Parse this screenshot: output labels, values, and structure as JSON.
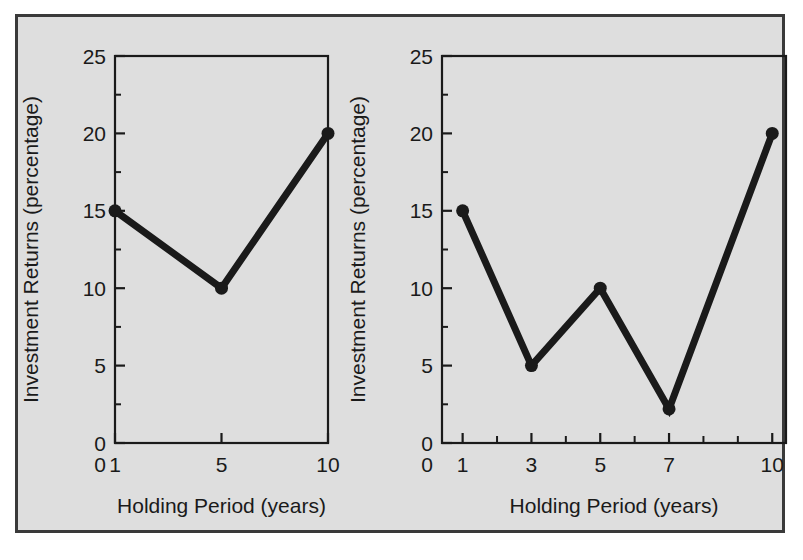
{
  "figure": {
    "background_color": "#dedede",
    "page_color": "#ffffff",
    "frame_color": "#3a3a3a",
    "series_color": "#1a1a1a"
  },
  "chart_data": [
    {
      "type": "line",
      "panel": "left",
      "title": "",
      "xlabel": "Holding Period (years)",
      "ylabel": "Investment Returns (percentage)",
      "x": [
        1,
        5,
        10
      ],
      "values": [
        15,
        10,
        20
      ],
      "xtick_labels": [
        "1",
        "5",
        "10"
      ],
      "xtick_values": [
        1,
        5,
        10
      ],
      "x_origin_label": "0",
      "ytick_labels": [
        "0",
        "5",
        "10",
        "15",
        "20",
        "25"
      ],
      "ytick_values": [
        0,
        5,
        10,
        15,
        20,
        25
      ],
      "yminor_values": [
        2.5,
        7.5,
        12.5,
        17.5,
        22.5
      ],
      "ylim": [
        0,
        25
      ],
      "grid": false,
      "legend": "none",
      "markers": "filled-circle",
      "x_spacing": "categorical"
    },
    {
      "type": "line",
      "panel": "right",
      "title": "",
      "xlabel": "Holding Period (years)",
      "ylabel": "Investment Returns (percentage)",
      "x": [
        1,
        3,
        5,
        7,
        10
      ],
      "values": [
        15,
        5,
        10,
        2.2,
        20
      ],
      "xtick_labels": [
        "1",
        "3",
        "5",
        "7",
        "10"
      ],
      "xtick_values": [
        1,
        3,
        5,
        7,
        10
      ],
      "xminor_values": [
        2,
        4,
        6,
        8,
        9
      ],
      "x_origin_label": "0",
      "ytick_labels": [
        "0",
        "5",
        "10",
        "15",
        "20",
        "25"
      ],
      "ytick_values": [
        0,
        5,
        10,
        15,
        20,
        25
      ],
      "yminor_values": [
        2.5,
        7.5,
        12.5,
        17.5,
        22.5
      ],
      "ylim": [
        0,
        25
      ],
      "xlim": [
        0.4,
        10.4
      ],
      "grid": false,
      "legend": "none",
      "markers": "filled-circle",
      "x_spacing": "linear"
    }
  ],
  "labels": {
    "left_xlabel": "Holding Period (years)",
    "left_ylabel": "Investment Returns (percentage)",
    "right_xlabel": "Holding Period (years)",
    "right_ylabel": "Investment Returns (percentage)",
    "origin_zero": "0"
  }
}
